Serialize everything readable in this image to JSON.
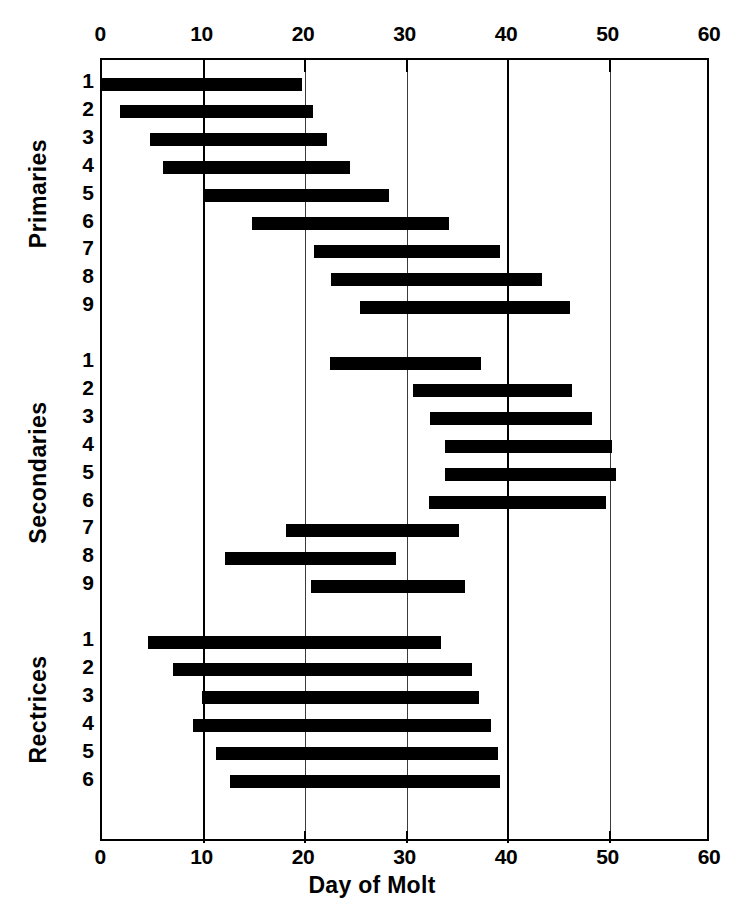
{
  "chart_data": {
    "type": "bar",
    "subtype": "horizontal-range-bar",
    "title": "",
    "xlabel": "Day of Molt",
    "ylabel": "",
    "xlim": [
      0,
      60
    ],
    "xticks": [
      0,
      10,
      20,
      30,
      40,
      50,
      60
    ],
    "xtick_labels": [
      "0",
      "10",
      "20",
      "30",
      "40",
      "50",
      "60"
    ],
    "grid": true,
    "gridlines_x": [
      10,
      20,
      30,
      40,
      50
    ],
    "major_gridlines_x": [
      10,
      40
    ],
    "legend": "none",
    "bar_color": "#000000",
    "axis_color": "#000000",
    "background_color": "#ffffff",
    "groups": [
      {
        "name": "Primaries",
        "rows": [
          {
            "label": "1",
            "start": 0,
            "end": 19.7
          },
          {
            "label": "2",
            "start": 1.8,
            "end": 20.8
          },
          {
            "label": "3",
            "start": 4.7,
            "end": 22.2
          },
          {
            "label": "4",
            "start": 6.0,
            "end": 24.4
          },
          {
            "label": "5",
            "start": 10.0,
            "end": 28.3
          },
          {
            "label": "6",
            "start": 14.8,
            "end": 34.2
          },
          {
            "label": "7",
            "start": 20.9,
            "end": 39.2
          },
          {
            "label": "8",
            "start": 22.6,
            "end": 43.4
          },
          {
            "label": "9",
            "start": 25.4,
            "end": 46.1
          }
        ]
      },
      {
        "name": "Secondaries",
        "rows": [
          {
            "label": "1",
            "start": 22.5,
            "end": 37.3
          },
          {
            "label": "2",
            "start": 30.6,
            "end": 46.3
          },
          {
            "label": "3",
            "start": 32.3,
            "end": 48.3
          },
          {
            "label": "4",
            "start": 33.8,
            "end": 50.2
          },
          {
            "label": "5",
            "start": 33.8,
            "end": 50.6
          },
          {
            "label": "6",
            "start": 32.2,
            "end": 49.7
          },
          {
            "label": "7",
            "start": 18.1,
            "end": 35.2
          },
          {
            "label": "8",
            "start": 12.1,
            "end": 29.0
          },
          {
            "label": "9",
            "start": 20.6,
            "end": 35.8
          }
        ]
      },
      {
        "name": "Rectrices",
        "rows": [
          {
            "label": "1",
            "start": 4.5,
            "end": 33.4
          },
          {
            "label": "2",
            "start": 7.0,
            "end": 36.5
          },
          {
            "label": "3",
            "start": 9.9,
            "end": 37.1
          },
          {
            "label": "4",
            "start": 9.0,
            "end": 38.3
          },
          {
            "label": "5",
            "start": 11.2,
            "end": 39.0
          },
          {
            "label": "6",
            "start": 12.6,
            "end": 39.2
          }
        ]
      }
    ]
  },
  "axis": {
    "x_title": "Day of Molt"
  },
  "icons": {}
}
